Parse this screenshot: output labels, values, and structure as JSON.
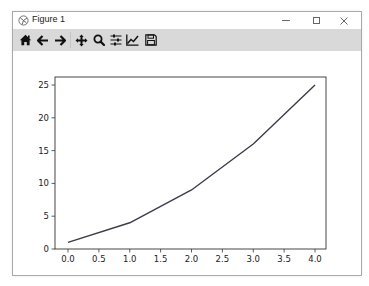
{
  "window": {
    "title": "Figure 1",
    "controls": {
      "minimize": "—",
      "maximize": "☐",
      "close": "✕"
    }
  },
  "toolbar": {
    "buttons": [
      {
        "name": "home",
        "icon": "home-icon"
      },
      {
        "name": "back",
        "icon": "arrow-left-icon"
      },
      {
        "name": "forward",
        "icon": "arrow-right-icon"
      },
      {
        "name": "pan",
        "icon": "move-icon"
      },
      {
        "name": "zoom",
        "icon": "magnifier-icon"
      },
      {
        "name": "configure-subplots",
        "icon": "sliders-icon"
      },
      {
        "name": "edit-axis",
        "icon": "line-chart-icon"
      },
      {
        "name": "save",
        "icon": "floppy-disk-icon"
      }
    ]
  },
  "chart_data": {
    "type": "line",
    "title": "",
    "xlabel": "",
    "ylabel": "",
    "x": [
      0,
      1,
      2,
      3,
      4
    ],
    "series": [
      {
        "name": "",
        "values": [
          1,
          4,
          9,
          16,
          25
        ],
        "color": "#3b3b4a"
      }
    ],
    "xlim": [
      -0.2,
      4.2
    ],
    "ylim": [
      -0.2,
      26.2
    ],
    "xticks": [
      "0.0",
      "0.5",
      "1.0",
      "1.5",
      "2.0",
      "2.5",
      "3.0",
      "3.5",
      "4.0"
    ],
    "yticks": [
      "0",
      "5",
      "10",
      "15",
      "20",
      "25"
    ],
    "grid": false,
    "legend": null
  },
  "colors": {
    "toolbar_bg": "#d9d9d9",
    "window_border": "#a9a9a9",
    "line": "#3b3b4a",
    "axes": "#333333"
  }
}
